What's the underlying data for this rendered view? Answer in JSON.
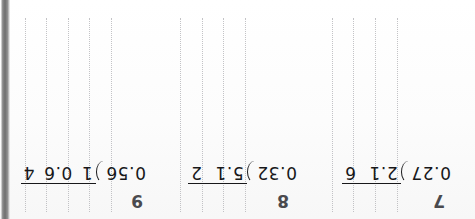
{
  "document": {
    "kind": "scanned-math-worksheet",
    "orientation": "upside-down",
    "page_background": "#fdfdfd",
    "ink_color": "#18181a",
    "gridline_color": "#b9b9bd",
    "scan_edge_color": "#6f6f6f"
  },
  "grid": {
    "top": 18,
    "bottom": 212,
    "columns_left": [
      25,
      46,
      68,
      89,
      111
    ],
    "columns_middle": [
      180,
      202,
      223,
      245
    ],
    "columns_right": [
      332,
      353,
      375,
      397
    ]
  },
  "problems": [
    {
      "number": "7",
      "divisor": "0.27",
      "bracket": ")",
      "dividend_part_1": "2.1",
      "dividend_part_2": "6",
      "full_expression": "0.27 ) 2.1 6"
    },
    {
      "number": "8",
      "divisor": "0.32",
      "bracket": ")",
      "dividend_part_1": "5.1",
      "dividend_part_2": "2",
      "full_expression": "0.32 ) 5.1 2"
    },
    {
      "number": "9",
      "divisor": "0.56",
      "bracket": ")",
      "dividend_part_1": "1",
      "dividend_part_2": "0.6",
      "dividend_part_3": "4",
      "full_expression": "0.56 ) 1 0.6 4"
    }
  ]
}
